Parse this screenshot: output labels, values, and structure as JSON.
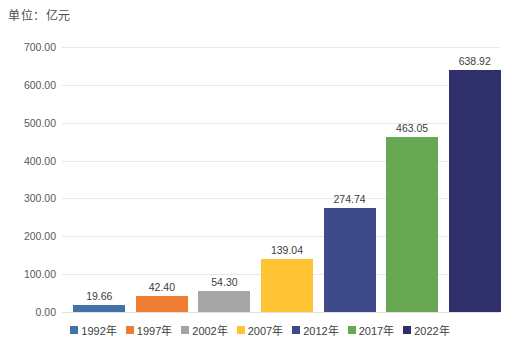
{
  "chart_data": {
    "type": "bar",
    "title": "单位：亿元",
    "xlabel": "",
    "ylabel": "",
    "categories": [
      "1992年",
      "1997年",
      "2002年",
      "2007年",
      "2012年",
      "2017年",
      "2022年"
    ],
    "values": [
      19.66,
      42.4,
      54.3,
      139.04,
      274.74,
      463.05,
      638.92
    ],
    "value_labels": [
      "19.66",
      "42.40",
      "54.30",
      "139.04",
      "274.74",
      "463.05",
      "638.92"
    ],
    "colors": [
      "#4472A8",
      "#ED7D31",
      "#A5A5A5",
      "#FFC433",
      "#3F4A8A",
      "#68A855",
      "#2E2F6B"
    ],
    "ylim": [
      0,
      700
    ],
    "ytick_step": 100,
    "ytick_labels": [
      "0.00",
      "100.00",
      "200.00",
      "300.00",
      "400.00",
      "500.00",
      "600.00",
      "700.00"
    ],
    "ytick_values": [
      0,
      100,
      200,
      300,
      400,
      500,
      600,
      700
    ],
    "grid": true,
    "legend_position": "bottom",
    "legend": [
      {
        "label": "1992年",
        "color": "#4472A8"
      },
      {
        "label": "1997年",
        "color": "#ED7D31"
      },
      {
        "label": "2002年",
        "color": "#A5A5A5"
      },
      {
        "label": "2007年",
        "color": "#FFC433"
      },
      {
        "label": "2012年",
        "color": "#3F4A8A"
      },
      {
        "label": "2017年",
        "color": "#68A855"
      },
      {
        "label": "2022年",
        "color": "#2E2F6B"
      }
    ]
  }
}
